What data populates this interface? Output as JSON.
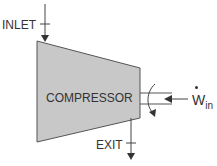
{
  "diagram": {
    "inlet_label": "INLET",
    "exit_label": "EXIT",
    "component_label": "COMPRESSOR",
    "work_symbol": "W",
    "work_subscript": "in",
    "colors": {
      "body_fill": "#c8c8c8",
      "stroke": "#444444",
      "text": "#333333"
    }
  }
}
